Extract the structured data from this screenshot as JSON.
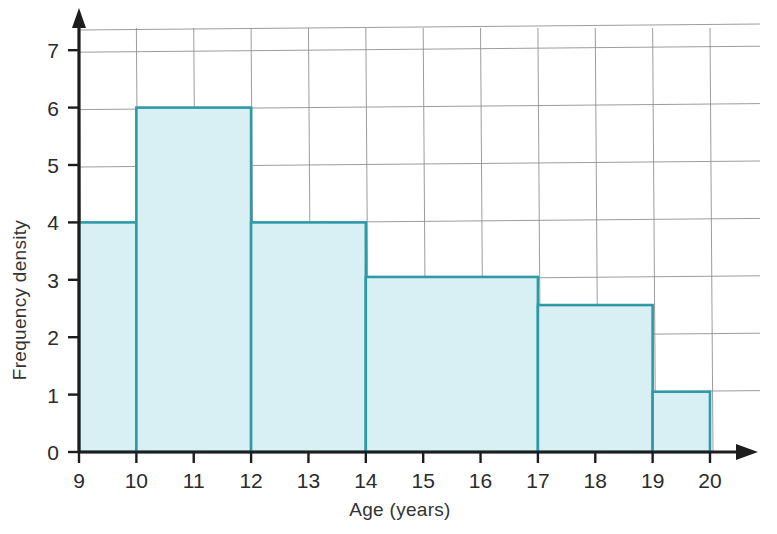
{
  "chart_data": {
    "type": "bar",
    "title": "",
    "subtitle": "",
    "xlabel": "Age (years)",
    "ylabel": "Frequency density",
    "xlim": [
      9,
      20
    ],
    "ylim": [
      0,
      7.6
    ],
    "grid": true,
    "legend": "none",
    "x_ticks": [
      "9",
      "10",
      "11",
      "12",
      "13",
      "14",
      "15",
      "16",
      "17",
      "18",
      "19",
      "20"
    ],
    "x_tick_values": [
      9,
      10,
      11,
      12,
      13,
      14,
      15,
      16,
      17,
      18,
      19,
      20
    ],
    "y_ticks": [
      "0",
      "1",
      "2",
      "3",
      "4",
      "5",
      "6",
      "7"
    ],
    "y_tick_values": [
      0,
      1,
      2,
      3,
      4,
      5,
      6,
      7
    ],
    "categories": [
      "9-10",
      "10-12",
      "12-14",
      "14-17",
      "17-19",
      "19-20"
    ],
    "values": [
      4,
      6,
      4,
      3.05,
      2.56,
      1.05
    ],
    "bins": [
      {
        "label": "9-10",
        "start": 9,
        "end": 10,
        "density": 4
      },
      {
        "label": "10-12",
        "start": 10,
        "end": 12,
        "density": 6
      },
      {
        "label": "12-14",
        "start": 12,
        "end": 14,
        "density": 4
      },
      {
        "label": "14-17",
        "start": 14,
        "end": 17,
        "density": 3.05
      },
      {
        "label": "17-19",
        "start": 17,
        "end": 19,
        "density": 2.56
      },
      {
        "label": "19-20",
        "start": 19,
        "end": 20,
        "density": 1.05
      }
    ],
    "colors": {
      "bar_fill": "#d8f0f4",
      "bar_stroke": "#2e9aa8",
      "gridline": "#8c8c8c",
      "axis": "#1d1d1d",
      "text": "#2b2b2b",
      "background": "#ffffff"
    }
  }
}
